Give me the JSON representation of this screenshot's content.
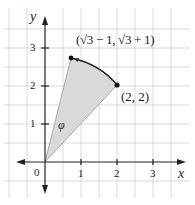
{
  "diagram": {
    "type": "coordinate-plane-sector",
    "axes": {
      "x_label": "x",
      "y_label": "y",
      "origin_label": "0",
      "x_ticks": [
        "1",
        "2",
        "3"
      ],
      "y_ticks": [
        "1",
        "2",
        "3"
      ]
    },
    "points": [
      {
        "id": "origin",
        "label": "",
        "x": 0,
        "y": 0
      },
      {
        "id": "rotated",
        "label": "(√3 − 1, √3 + 1)",
        "x": 0.732,
        "y": 2.732
      },
      {
        "id": "start",
        "label": "(2, 2)",
        "x": 2,
        "y": 2
      }
    ],
    "angle_label": "φ",
    "colors": {
      "grid": "#cfcfcf",
      "axis": "#222222",
      "fill": "#d9d9d9",
      "edge": "#9a9a9a",
      "arc": "#222222",
      "point": "#111111"
    }
  }
}
